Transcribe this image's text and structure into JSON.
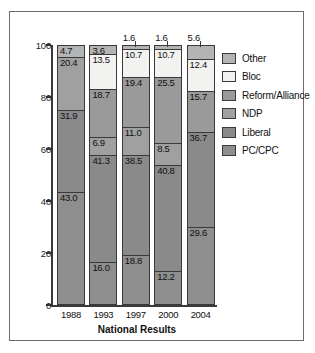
{
  "chart_data": {
    "type": "bar",
    "subtype": "stacked-percentage-column",
    "title": "",
    "xlabel": "National Results",
    "ylabel": "",
    "ylim": [
      0,
      100
    ],
    "yticks": [
      0,
      20,
      40,
      60,
      80,
      100
    ],
    "ytick_labels": [
      "0",
      "20",
      "40",
      "60",
      "80",
      "100"
    ],
    "grid": false,
    "legend_position": "right",
    "categories": [
      "1988",
      "1993",
      "1997",
      "2000",
      "2004"
    ],
    "series": [
      {
        "name": "PC/CPC",
        "color": "#8e8e8e",
        "values": [
          43.0,
          16.0,
          18.8,
          12.2,
          29.6
        ]
      },
      {
        "name": "Liberal",
        "color": "#8a8a8a",
        "values": [
          31.9,
          41.3,
          38.5,
          40.8,
          36.7
        ]
      },
      {
        "name": "NDP",
        "color": "#a0a0a0",
        "values": [
          20.4,
          6.9,
          11.0,
          8.5,
          null
        ]
      },
      {
        "name": "Reform/Alliance",
        "color": "#9a9a9a",
        "values": [
          null,
          18.7,
          19.4,
          25.5,
          15.7
        ]
      },
      {
        "name": "Bloc",
        "color": "#f2f2f0",
        "values": [
          null,
          13.5,
          10.7,
          10.7,
          12.4
        ]
      },
      {
        "name": "Other",
        "color": "#b4b4b4",
        "values": [
          4.7,
          3.6,
          1.6,
          1.6,
          5.6
        ]
      }
    ],
    "bars": [
      {
        "year": "1988",
        "segments": [
          {
            "party": "Other",
            "value": 4.7,
            "label": "4.7",
            "color": "#b4b4b4",
            "tiny": false
          },
          {
            "party": "NDP",
            "value": 20.4,
            "label": "20.4",
            "color": "#a0a0a0",
            "tiny": false
          },
          {
            "party": "Liberal",
            "value": 31.9,
            "label": "31.9",
            "color": "#8a8a8a",
            "tiny": false
          },
          {
            "party": "PC/CPC",
            "value": 43.0,
            "label": "43.0",
            "color": "#8e8e8e",
            "tiny": false
          }
        ]
      },
      {
        "year": "1993",
        "segments": [
          {
            "party": "Other",
            "value": 3.6,
            "label": "3.6",
            "color": "#b4b4b4",
            "tiny": false
          },
          {
            "party": "Bloc",
            "value": 13.5,
            "label": "13.5",
            "color": "#f2f2f0",
            "tiny": false
          },
          {
            "party": "Reform/Alliance",
            "value": 18.7,
            "label": "18.7",
            "color": "#9a9a9a",
            "tiny": false
          },
          {
            "party": "NDP",
            "value": 6.9,
            "label": "6.9",
            "color": "#a0a0a0",
            "tiny": false
          },
          {
            "party": "Liberal",
            "value": 41.3,
            "label": "41.3",
            "color": "#8a8a8a",
            "tiny": false
          },
          {
            "party": "PC/CPC",
            "value": 16.0,
            "label": "16.0",
            "color": "#8e8e8e",
            "tiny": false
          }
        ]
      },
      {
        "year": "1997",
        "segments": [
          {
            "party": "Other",
            "value": 1.6,
            "label": "1.6",
            "color": "#b4b4b4",
            "tiny": true
          },
          {
            "party": "Bloc",
            "value": 10.7,
            "label": "10.7",
            "color": "#f2f2f0",
            "tiny": false
          },
          {
            "party": "Reform/Alliance",
            "value": 19.4,
            "label": "19.4",
            "color": "#9a9a9a",
            "tiny": false
          },
          {
            "party": "NDP",
            "value": 11.0,
            "label": "11.0",
            "color": "#a0a0a0",
            "tiny": false
          },
          {
            "party": "Liberal",
            "value": 38.5,
            "label": "38.5",
            "color": "#8a8a8a",
            "tiny": false
          },
          {
            "party": "PC/CPC",
            "value": 18.8,
            "label": "18.8",
            "color": "#8e8e8e",
            "tiny": false
          }
        ]
      },
      {
        "year": "2000",
        "segments": [
          {
            "party": "Other",
            "value": 1.6,
            "label": "1.6",
            "color": "#b4b4b4",
            "tiny": true
          },
          {
            "party": "Bloc",
            "value": 10.7,
            "label": "10.7",
            "color": "#f2f2f0",
            "tiny": false
          },
          {
            "party": "Reform/Alliance",
            "value": 25.5,
            "label": "25.5",
            "color": "#9a9a9a",
            "tiny": false
          },
          {
            "party": "NDP",
            "value": 8.5,
            "label": "8.5",
            "color": "#a0a0a0",
            "tiny": false
          },
          {
            "party": "Liberal",
            "value": 40.8,
            "label": "40.8",
            "color": "#8a8a8a",
            "tiny": false
          },
          {
            "party": "PC/CPC",
            "value": 12.2,
            "label": "12.2",
            "color": "#8e8e8e",
            "tiny": false
          }
        ]
      },
      {
        "year": "2004",
        "segments": [
          {
            "party": "Other",
            "value": 5.6,
            "label": "5.6",
            "color": "#b4b4b4",
            "tiny": true
          },
          {
            "party": "Bloc",
            "value": 12.4,
            "label": "12.4",
            "color": "#f2f2f0",
            "tiny": false
          },
          {
            "party": "Reform/Alliance",
            "value": 15.7,
            "label": "15.7",
            "color": "#9a9a9a",
            "tiny": false
          },
          {
            "party": "Liberal",
            "value": 36.7,
            "label": "36.7",
            "color": "#8a8a8a",
            "tiny": false
          },
          {
            "party": "PC/CPC",
            "value": 29.6,
            "label": "29.6",
            "color": "#8e8e8e",
            "tiny": false
          }
        ]
      }
    ],
    "legend": [
      {
        "label": "Other",
        "color": "#b4b4b4"
      },
      {
        "label": "Bloc",
        "color": "#f2f2f0"
      },
      {
        "label": "Reform/Alliance",
        "color": "#9a9a9a"
      },
      {
        "label": "NDP",
        "color": "#a0a0a0"
      },
      {
        "label": "Liberal",
        "color": "#8a8a8a"
      },
      {
        "label": "PC/CPC",
        "color": "#8e8e8e"
      }
    ]
  }
}
